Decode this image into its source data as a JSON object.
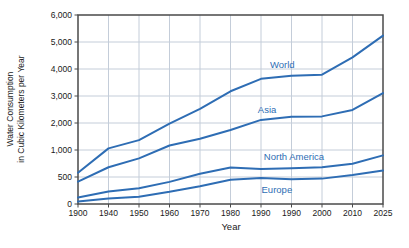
{
  "figure": {
    "y_axis_title_line1": "Water Consumption",
    "y_axis_title_line2": "in Cubic Kilometers per Year",
    "x_axis_title": "Year"
  },
  "colors": {
    "series_line": "#2e6db4",
    "series_label": "#2e6db4",
    "grid": "#c4cdd9",
    "border": "#4a4a4a",
    "tick_text": "#1a1a1a"
  },
  "chart_data": {
    "type": "line",
    "title": "",
    "xlabel": "Year",
    "ylabel": "Water Consumption in Cubic Kilometers per Year",
    "x_tick_labels": [
      "1900",
      "1940",
      "1950",
      "1960",
      "1970",
      "1980",
      "1990",
      "1990",
      "2000",
      "2010",
      "2025"
    ],
    "y_tick_labels": [
      "0",
      "500",
      "1,000",
      "2,000",
      "3,000",
      "4,000",
      "5,000",
      "6,000"
    ],
    "y_tick_values": [
      0,
      500,
      1000,
      2000,
      3000,
      4000,
      5000,
      6000
    ],
    "y_axis_note": "ticks evenly spaced although intervals differ (500 then 1000 steps)",
    "grid": "on",
    "legend_position": "labels-on-lines",
    "series": [
      {
        "name": "World",
        "values": [
          580,
          1060,
          1365,
          1980,
          2525,
          3175,
          3635,
          3750,
          3790,
          4430,
          5235
        ]
      },
      {
        "name": "Asia",
        "values": [
          415,
          680,
          845,
          1165,
          1415,
          1740,
          2115,
          2230,
          2245,
          2485,
          3105
        ]
      },
      {
        "name": "North America",
        "values": [
          120,
          230,
          290,
          410,
          560,
          675,
          650,
          660,
          680,
          745,
          900
        ]
      },
      {
        "name": "Europe",
        "values": [
          45,
          100,
          135,
          225,
          330,
          450,
          480,
          460,
          470,
          535,
          620
        ]
      }
    ]
  }
}
